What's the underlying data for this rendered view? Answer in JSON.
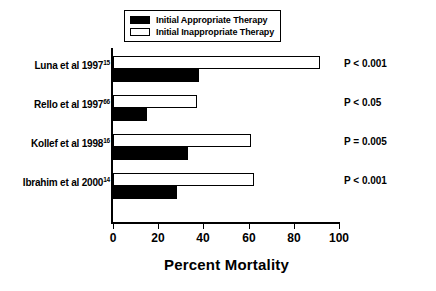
{
  "chart_data": {
    "type": "bar",
    "orientation": "horizontal",
    "title": "",
    "xlabel": "Percent Mortality",
    "ylabel": "",
    "xlim": [
      0,
      100
    ],
    "xticks": [
      0,
      20,
      40,
      60,
      80,
      100
    ],
    "xtick_labels": [
      "0",
      "20",
      "40",
      "60",
      "80",
      "100"
    ],
    "grid": false,
    "legend_position": "top-center",
    "categories": [
      "Luna et al 1997",
      "Rello et al 1997",
      "Kollef et al 1998",
      "Ibrahim et al 2000"
    ],
    "category_superscripts": [
      "15",
      "66",
      "16",
      "14"
    ],
    "series": [
      {
        "name": "Initial Appropriate Therapy",
        "fill": "#000000",
        "values": [
          38,
          15,
          33,
          28
        ]
      },
      {
        "name": "Initial Inappropriate Therapy",
        "fill": "#ffffff",
        "values": [
          91,
          37,
          61,
          62
        ]
      }
    ],
    "annotations": [
      "P < 0.001",
      "P < 0.05",
      "P = 0.005",
      "P < 0.001"
    ]
  },
  "legend": {
    "items": [
      {
        "label": "Initial Appropriate Therapy",
        "swatch": "filled"
      },
      {
        "label": "Initial Inappropriate Therapy",
        "swatch": "open"
      }
    ]
  },
  "colors": {
    "appropriate": "#000000",
    "inappropriate": "#ffffff",
    "axis": "#000000",
    "background": "#ffffff"
  }
}
